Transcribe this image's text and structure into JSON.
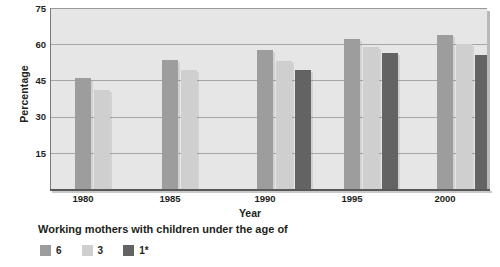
{
  "chart_data": {
    "type": "bar",
    "title": "",
    "subtitle": "",
    "xlabel": "Year",
    "ylabel": "Percentage",
    "categories": [
      "1980",
      "1985",
      "1990",
      "1995",
      "2000"
    ],
    "yticks": [
      15,
      30,
      45,
      60,
      75
    ],
    "ylim": [
      0,
      75
    ],
    "grid": true,
    "legend_position": "bottom-left",
    "legend_caption": "Working mothers with children under the age of",
    "series": [
      {
        "name": "6",
        "label": "6",
        "color": "#9d9d9d",
        "values": [
          46,
          53.5,
          57.5,
          62,
          64
        ]
      },
      {
        "name": "3",
        "label": "3",
        "color": "#cfcfcf",
        "values": [
          41,
          49.5,
          53,
          59,
          60
        ]
      },
      {
        "name": "1*",
        "label": "1*",
        "color": "#636363",
        "values": [
          null,
          null,
          49.5,
          56.5,
          55.5
        ]
      }
    ],
    "annotations": []
  },
  "axes": {
    "y_title": "Percentage",
    "x_title": "Year",
    "y_tick_labels": [
      "75",
      "60",
      "45",
      "30",
      "15"
    ],
    "x_tick_labels": [
      "1980",
      "1985",
      "1990",
      "1995",
      "2000"
    ]
  },
  "legend": {
    "caption": "Working mothers with children under the age of",
    "items": [
      {
        "label": "6",
        "color": "#9d9d9d"
      },
      {
        "label": "3",
        "color": "#cfcfcf"
      },
      {
        "label": "1*",
        "color": "#636363"
      }
    ]
  },
  "colors": {
    "plot_background": "#e6e6e6",
    "gridline": "#a6a6a6",
    "axis": "#585858",
    "text": "#231f20"
  }
}
